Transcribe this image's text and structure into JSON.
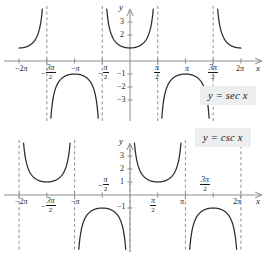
{
  "figure": {
    "title": "",
    "panels": [
      "sec",
      "csc"
    ]
  },
  "chart_data": [
    {
      "type": "line",
      "title": "",
      "legend_label": "y = sec x",
      "function": "sec",
      "xlabel": "x",
      "ylabel": "y",
      "xlim": [
        -7.1,
        7.1
      ],
      "ylim": [
        -3.9,
        3.9
      ],
      "grid": false,
      "legend_position": "right",
      "xticks": [
        -6.283185,
        -4.712389,
        -3.141593,
        -1.570796,
        1.570796,
        3.141593,
        4.712389,
        6.283185
      ],
      "xticklabels": [
        "-2π",
        "-3π/2",
        "-π",
        "-π/2",
        "π/2",
        "π",
        "3π/2",
        "2π"
      ],
      "yticks": [
        3,
        2,
        -1,
        -2,
        -3
      ],
      "yticklabels": [
        "3",
        "2",
        "-1",
        "-2",
        "-3"
      ],
      "asymptotes": [
        -4.712389,
        -1.570796,
        1.570796,
        4.712389
      ],
      "asymptote_labels": [
        "-3π/2",
        "-π/2",
        "π/2",
        "3π/2"
      ],
      "branches": [
        {
          "domain": [
            -6.283185,
            -4.712389
          ],
          "min_abs_value": 1,
          "sign": "positive"
        },
        {
          "domain": [
            -4.712389,
            -1.570796
          ],
          "min_abs_value": 1,
          "sign": "negative"
        },
        {
          "domain": [
            -1.570796,
            1.570796
          ],
          "min_abs_value": 1,
          "sign": "positive"
        },
        {
          "domain": [
            1.570796,
            4.712389
          ],
          "min_abs_value": 1,
          "sign": "negative"
        },
        {
          "domain": [
            4.712389,
            6.283185
          ],
          "min_abs_value": 1,
          "sign": "positive"
        }
      ]
    },
    {
      "type": "line",
      "title": "",
      "legend_label": "y = csc x",
      "function": "csc",
      "xlabel": "x",
      "ylabel": "y",
      "xlim": [
        -7.1,
        7.1
      ],
      "ylim": [
        -3.9,
        3.9
      ],
      "grid": false,
      "legend_position": "right",
      "xticks": [
        -6.283185,
        -4.712389,
        -3.141593,
        -1.570796,
        1.570796,
        3.141593,
        4.712389,
        6.283185
      ],
      "xticklabels": [
        "-2π",
        "-3π/2",
        "-π",
        "-π/2",
        "π/2",
        "π",
        "3π/2",
        "2π"
      ],
      "yticks": [
        3,
        2,
        1,
        -1
      ],
      "yticklabels": [
        "3",
        "2",
        "1",
        "-1"
      ],
      "asymptotes": [
        -6.283185,
        -3.141593,
        0,
        3.141593,
        6.283185
      ],
      "asymptote_labels": [
        "-2π",
        "-π",
        "0",
        "π",
        "2π"
      ],
      "branches": [
        {
          "domain": [
            -6.283185,
            -3.141593
          ],
          "min_abs_value": 1,
          "sign": "positive"
        },
        {
          "domain": [
            -3.141593,
            0
          ],
          "min_abs_value": 1,
          "sign": "negative"
        },
        {
          "domain": [
            0,
            3.141593
          ],
          "min_abs_value": 1,
          "sign": "positive"
        },
        {
          "domain": [
            3.141593,
            6.283185
          ],
          "min_abs_value": 1,
          "sign": "negative"
        }
      ]
    }
  ],
  "labels": {
    "sec": {
      "axis_x": "x",
      "axis_y": "y",
      "legend": "y = sec x",
      "xticks": [
        {
          "text": "-2",
          "pi": "π",
          "kind": "plain"
        },
        {
          "num": "3π",
          "den": "2",
          "kind": "frac",
          "sign": "-"
        },
        {
          "text": "-",
          "pi": "π",
          "kind": "plain"
        },
        {
          "num": "π",
          "den": "2",
          "kind": "frac",
          "sign": "-"
        },
        {
          "num": "π",
          "den": "2",
          "kind": "frac",
          "sign": ""
        },
        {
          "text": "",
          "pi": "π",
          "kind": "plain"
        },
        {
          "num": "3π",
          "den": "2",
          "kind": "frac",
          "sign": ""
        },
        {
          "text": "2",
          "pi": "π",
          "kind": "plain"
        }
      ],
      "yticks": [
        "3",
        "2",
        "−1",
        "−2",
        "−3"
      ]
    },
    "csc": {
      "axis_x": "x",
      "axis_y": "y",
      "legend": "y = csc x",
      "xticks": [
        {
          "text": "-2",
          "pi": "π",
          "kind": "plain"
        },
        {
          "num": "3π",
          "den": "2",
          "kind": "frac",
          "sign": "-"
        },
        {
          "text": "-",
          "pi": "π",
          "kind": "plain"
        },
        {
          "num": "π",
          "den": "2",
          "kind": "frac",
          "sign": "-"
        },
        {
          "num": "π",
          "den": "2",
          "kind": "frac",
          "sign": ""
        },
        {
          "text": "",
          "pi": "π",
          "kind": "plain"
        },
        {
          "num": "3π",
          "den": "2",
          "kind": "frac",
          "sign": ""
        },
        {
          "text": "2",
          "pi": "π",
          "kind": "plain"
        }
      ],
      "yticks": [
        "3",
        "2",
        "1",
        "−1"
      ]
    }
  },
  "colors": {
    "curve": "#2b2b2b",
    "axis": "#8d8d8d",
    "asymptote": "#9a9a9a",
    "legend_bg": "#eceef0",
    "text": "#1b1b1b",
    "background": "#ffffff"
  }
}
